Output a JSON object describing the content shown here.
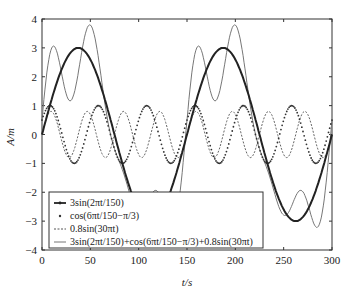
{
  "chart_data": {
    "type": "line",
    "title": "",
    "xlabel": "t/s",
    "ylabel": "A/m",
    "xlim": [
      0,
      300
    ],
    "ylim": [
      -4,
      4
    ],
    "xticks": [
      0,
      50,
      100,
      150,
      200,
      250,
      300
    ],
    "yticks": [
      -4,
      -3,
      -2,
      -1,
      0,
      1,
      2,
      3,
      4
    ],
    "grid": false,
    "legend_position": "lower left",
    "series": [
      {
        "name": "3sin(2πt/150)",
        "style": "solid-bold-markers",
        "color": "#222222",
        "amplitude": 3,
        "period": 150,
        "phase": 0,
        "x": [
          0,
          37.5,
          75,
          112.5,
          150,
          187.5,
          225,
          262.5,
          300
        ],
        "values": [
          0,
          3,
          0,
          -3,
          0,
          3,
          0,
          -3,
          0
        ]
      },
      {
        "name": "cos(6πt/150−π/3)",
        "style": "dotted",
        "color": "#333333",
        "amplitude": 1,
        "period": 50,
        "phase": -1.0472,
        "x": [
          0,
          8.3,
          33.3,
          58.3,
          83.3,
          108.3,
          133.3,
          158.3,
          183.3,
          208.3,
          233.3,
          258.3,
          283.3,
          300
        ],
        "values": [
          0.5,
          1,
          -1,
          1,
          -1,
          1,
          -1,
          1,
          -1,
          1,
          -1,
          1,
          -1,
          0.5
        ]
      },
      {
        "name": "0.8sin(30πt)",
        "style": "dashed",
        "color": "#666666",
        "amplitude": 0.8,
        "period": 37.5,
        "phase": 0,
        "x": [
          0,
          9.4,
          28.1,
          46.9,
          65.6,
          84.4,
          103.1,
          121.9,
          140.6,
          159.4,
          178.1,
          196.9,
          215.6,
          234.4,
          253.1,
          271.9,
          290.6,
          300
        ],
        "values": [
          0,
          0.8,
          -0.8,
          0.8,
          -0.8,
          0.8,
          -0.8,
          0.8,
          -0.8,
          0.8,
          -0.8,
          0.8,
          -0.8,
          0.8,
          -0.8,
          0.8,
          -0.8,
          0
        ]
      },
      {
        "name": "3sin(2πt/150)+cos(6πt/150−π/3)+0.8sin(30πt)",
        "style": "solid-thin",
        "color": "#777777",
        "x": [
          0,
          15,
          28,
          48,
          75,
          100,
          118,
          135,
          150,
          165,
          178,
          198,
          225,
          250,
          268,
          285,
          300
        ],
        "values": [
          0.5,
          3.1,
          1.2,
          3.8,
          0.3,
          -1.2,
          -1.1,
          -3.2,
          -0.3,
          3.0,
          1.2,
          3.8,
          0.3,
          -1.2,
          -1.1,
          -3.2,
          0.5
        ]
      }
    ]
  },
  "legend": {
    "items": [
      {
        "label": "3sin(2πt/150)"
      },
      {
        "label": "cos(6πt/150−π/3)"
      },
      {
        "label": "0.8sin(30πt)"
      },
      {
        "label": "3sin(2πt/150)+cos(6πt/150−π/3)+0.8sin(30πt)"
      }
    ]
  },
  "axes": {
    "x_label": "t/s",
    "y_label": "A/m"
  }
}
